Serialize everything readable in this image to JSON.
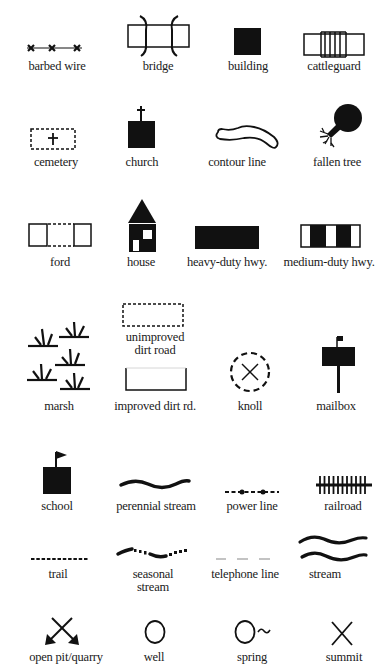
{
  "legend": {
    "title": "Topographic map symbols",
    "items": [
      {
        "id": "barbed-wire",
        "label": "barbed wire"
      },
      {
        "id": "bridge",
        "label": "bridge"
      },
      {
        "id": "building",
        "label": "building"
      },
      {
        "id": "cattleguard",
        "label": "cattleguard"
      },
      {
        "id": "cemetery",
        "label": "cemetery"
      },
      {
        "id": "church",
        "label": "church"
      },
      {
        "id": "contour-line",
        "label": "contour line"
      },
      {
        "id": "fallen-tree",
        "label": "fallen tree"
      },
      {
        "id": "ford",
        "label": "ford"
      },
      {
        "id": "house",
        "label": "house"
      },
      {
        "id": "heavy-duty-hwy",
        "label": "heavy-duty hwy."
      },
      {
        "id": "medium-duty-hwy",
        "label": "medium-duty hwy."
      },
      {
        "id": "unimproved-dirt-road",
        "label_line1": "unimproved",
        "label_line2": "dirt road"
      },
      {
        "id": "marsh",
        "label": "marsh"
      },
      {
        "id": "improved-dirt-rd",
        "label": "improved dirt rd."
      },
      {
        "id": "knoll",
        "label": "knoll"
      },
      {
        "id": "mailbox",
        "label": "mailbox"
      },
      {
        "id": "school",
        "label": "school"
      },
      {
        "id": "perennial-stream",
        "label": "perennial stream"
      },
      {
        "id": "power-line",
        "label": "power line"
      },
      {
        "id": "railroad",
        "label": "railroad"
      },
      {
        "id": "trail",
        "label": "trail"
      },
      {
        "id": "seasonal-stream",
        "label_line1": "seasonal",
        "label_line2": "stream"
      },
      {
        "id": "telephone-line",
        "label": "telephone line"
      },
      {
        "id": "stream",
        "label": "stream"
      },
      {
        "id": "open-pit-quarry",
        "label": "open pit/quarry"
      },
      {
        "id": "well",
        "label": "well"
      },
      {
        "id": "spring",
        "label": "spring"
      },
      {
        "id": "summit",
        "label": "summit"
      }
    ]
  },
  "colors": {
    "ink": "#111111",
    "light_line": "#9a9a9a",
    "background": "#ffffff"
  }
}
